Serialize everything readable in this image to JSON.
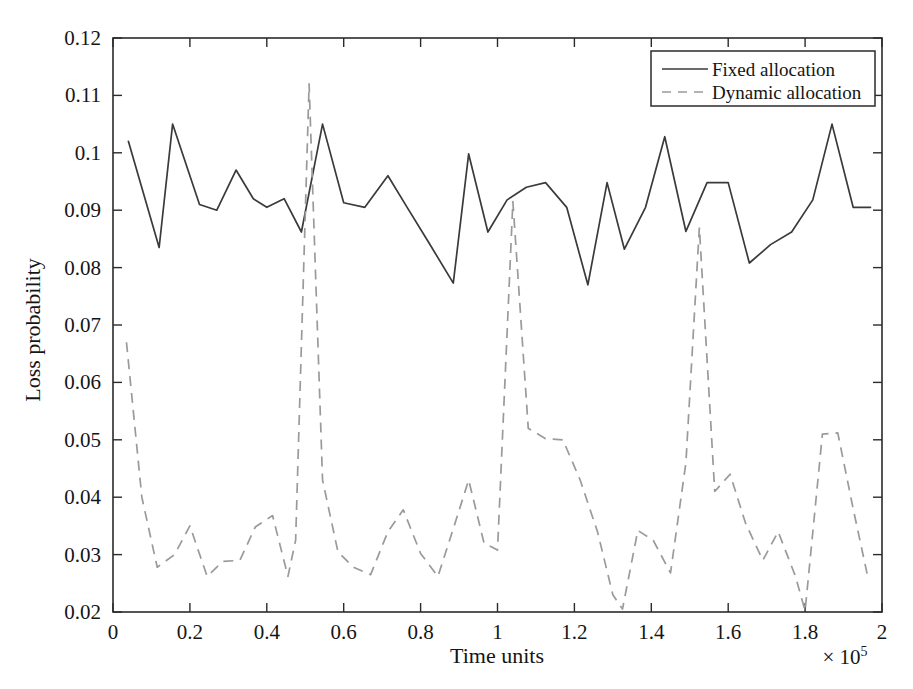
{
  "chart_data": {
    "type": "line",
    "title": "",
    "xlabel": "Time units",
    "ylabel": "Loss probability",
    "x_multiplier": "× 10",
    "x_multiplier_exponent": "5",
    "xlim": [
      0,
      2
    ],
    "ylim": [
      0.02,
      0.12
    ],
    "grid": false,
    "x_ticks": [
      "0",
      "0.2",
      "0.4",
      "0.6",
      "0.8",
      "1",
      "1.2",
      "1.4",
      "1.6",
      "1.8",
      "2"
    ],
    "x_tick_values": [
      0,
      0.2,
      0.4,
      0.6,
      0.8,
      1,
      1.2,
      1.4,
      1.6,
      1.8,
      2
    ],
    "y_ticks": [
      "0.02",
      "0.03",
      "0.04",
      "0.05",
      "0.06",
      "0.07",
      "0.08",
      "0.09",
      "0.1",
      "0.11",
      "0.12"
    ],
    "y_tick_values": [
      0.02,
      0.03,
      0.04,
      0.05,
      0.06,
      0.07,
      0.08,
      0.09,
      0.1,
      0.11,
      0.12
    ],
    "legend_position": "top-right",
    "series": [
      {
        "name": "Fixed allocation",
        "style": "solid",
        "color": "#3a3a3a",
        "x": [
          0.04,
          0.12,
          0.155,
          0.225,
          0.27,
          0.32,
          0.365,
          0.4,
          0.445,
          0.49,
          0.545,
          0.6,
          0.655,
          0.715,
          0.765,
          0.82,
          0.885,
          0.925,
          0.975,
          1.025,
          1.075,
          1.125,
          1.18,
          1.235,
          1.285,
          1.33,
          1.385,
          1.435,
          1.49,
          1.545,
          1.6,
          1.655,
          1.71,
          1.765,
          1.82,
          1.87,
          1.925,
          1.97
        ],
        "y": [
          0.102,
          0.0835,
          0.105,
          0.091,
          0.09,
          0.097,
          0.092,
          0.0905,
          0.092,
          0.0862,
          0.105,
          0.0913,
          0.0905,
          0.096,
          0.0905,
          0.0845,
          0.0773,
          0.0998,
          0.0862,
          0.0918,
          0.094,
          0.0948,
          0.0905,
          0.077,
          0.0948,
          0.0832,
          0.0905,
          0.1028,
          0.0863,
          0.0948,
          0.0948,
          0.0808,
          0.084,
          0.0862,
          0.0918,
          0.105,
          0.0905,
          0.0905
        ]
      },
      {
        "name": "Dynamic allocation",
        "style": "dashed",
        "color": "#9a9a9a",
        "x": [
          0.035,
          0.075,
          0.115,
          0.16,
          0.2,
          0.245,
          0.285,
          0.33,
          0.37,
          0.415,
          0.455,
          0.475,
          0.51,
          0.545,
          0.585,
          0.625,
          0.67,
          0.715,
          0.755,
          0.8,
          0.845,
          0.885,
          0.925,
          0.965,
          1.0,
          1.04,
          1.08,
          1.125,
          1.17,
          1.215,
          1.26,
          1.3,
          1.325,
          1.365,
          1.405,
          1.45,
          1.49,
          1.525,
          1.565,
          1.605,
          1.645,
          1.69,
          1.73,
          1.775,
          1.8,
          1.845,
          1.885,
          1.925,
          1.965
        ],
        "y": [
          0.067,
          0.04,
          0.0278,
          0.03,
          0.035,
          0.0262,
          0.0288,
          0.029,
          0.0348,
          0.0368,
          0.0262,
          0.0325,
          0.112,
          0.043,
          0.0305,
          0.0278,
          0.0265,
          0.034,
          0.0378,
          0.0302,
          0.0262,
          0.0345,
          0.043,
          0.032,
          0.0308,
          0.0915,
          0.052,
          0.0502,
          0.05,
          0.043,
          0.034,
          0.023,
          0.0205,
          0.0342,
          0.0325,
          0.0268,
          0.046,
          0.087,
          0.041,
          0.044,
          0.0355,
          0.029,
          0.034,
          0.0262,
          0.0202,
          0.051,
          0.0512,
          0.038,
          0.0255
        ]
      }
    ]
  },
  "legend": {
    "items": [
      {
        "label": "Fixed allocation",
        "style": "solid"
      },
      {
        "label": "Dynamic allocation",
        "style": "dashed"
      }
    ]
  }
}
